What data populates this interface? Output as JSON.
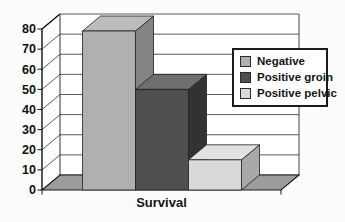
{
  "chart_data": {
    "type": "bar",
    "style": "3d-column",
    "title": "",
    "xlabel": "",
    "ylabel": "",
    "categories": [
      "Survival"
    ],
    "series": [
      {
        "name": "Negative",
        "values": [
          79
        ],
        "color": {
          "front": "#b0b0b0",
          "top": "#bcbcbc",
          "side": "#848484"
        }
      },
      {
        "name": "Positive groin",
        "values": [
          50
        ],
        "color": {
          "front": "#4f4f4f",
          "top": "#6f6f6f",
          "side": "#323232"
        }
      },
      {
        "name": "Positive pelvic",
        "values": [
          15
        ],
        "color": {
          "front": "#d9d9d9",
          "top": "#e2e2e2",
          "side": "#a8a8a8"
        }
      }
    ],
    "ylim": [
      0,
      80
    ],
    "yticks": [
      0,
      10,
      20,
      30,
      40,
      50,
      60,
      70,
      80
    ],
    "grid": true,
    "legend_position": "right",
    "colors": {
      "background": "#fcfcfc",
      "wall": "#ffffff",
      "floor": "#9c9c9c",
      "gridline": "#4a4a4a",
      "axis": "#111111",
      "tick_label": "#111111",
      "legend_border": "#1a1a1a",
      "legend_background": "#ffffff"
    }
  }
}
